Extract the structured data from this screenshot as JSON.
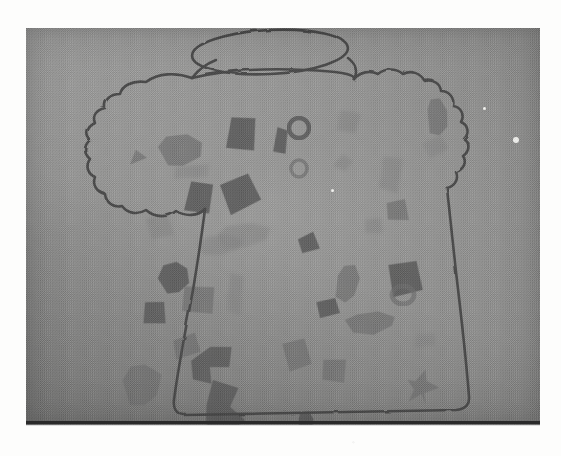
{
  "figure": {
    "kind": "halftone-photograph-of-childrens-drawing",
    "caption": "",
    "label": ""
  },
  "colors": {
    "page_background": "#fdfdfc",
    "photo_paper_mid": "#8e8e8e",
    "photo_paper_light": "#9a9a99",
    "photo_paper_dark": "#767675",
    "pencil_outline": "#4b4b4b",
    "confetti_dark": "#5e5e5e",
    "confetti_mid": "#6e6e6e",
    "confetti_light": "#7e7e7e",
    "bottom_rule": "#2a2a2a",
    "speck_highlight": "#f2f2ef"
  },
  "photo_plate": {
    "x": 26,
    "y": 28,
    "width": 514,
    "height": 397
  },
  "bottom_rule": {
    "x": 26,
    "y": 421,
    "width": 514,
    "height": 3
  },
  "outline": {
    "stroke_width": 2.6,
    "stroke_color": "#4b4b4b",
    "lid_oval": {
      "cx": 244,
      "cy": 24,
      "rx": 78,
      "ry": 22,
      "rotate": -3
    },
    "ruffle_top_path": "M 166 50 C 150 44 132 45 120 54 C 106 52 96 58 94 66 C 84 66 78 72 79 80 C 70 82 66 88 69 95 C 61 99 59 106 64 112 C 57 118 58 126 64 131 C 59 138 62 146 69 149 C 66 157 71 164 79 166 C 80 175 88 180 96 178 C 102 186 112 187 120 182 C 129 190 142 190 150 183 C 160 189 172 188 179 181",
    "body_path": "M 179 181 C 176 205 172 232 167 262 C 160 300 152 340 148 372 C 147 380 150 386 158 387 L 430 382 C 440 381 444 376 443 368 C 440 330 435 286 430 244 C 426 208 423 180 421 160",
    "ruffle_right_path": "M 421 160 C 429 158 433 151 430 144 C 438 141 441 134 437 128 C 444 123 444 115 438 111 C 444 105 442 97 435 94 C 439 87 435 79 427 78 C 429 70 423 63 415 63 C 414 55 406 50 398 52 C 394 45 385 42 377 46 C 370 40 359 40 352 46 C 344 42 334 44 328 51",
    "ruffle_span_path": "M 166 50 C 200 42 240 40 280 42 C 310 43 330 46 328 51",
    "lid_tab_left": "M 166 50 C 172 42 180 36 190 32",
    "lid_tab_right": "M 322 30 C 330 36 332 44 328 51"
  },
  "confetti": [
    {
      "id": "c01",
      "x": 102,
      "y": 122,
      "w": 18,
      "h": 12,
      "rot": -18,
      "tone": "mid",
      "shape": "triangle"
    },
    {
      "id": "c02",
      "x": 130,
      "y": 108,
      "w": 46,
      "h": 30,
      "rot": -8,
      "tone": "mid",
      "shape": "blob"
    },
    {
      "id": "c03",
      "x": 148,
      "y": 138,
      "w": 36,
      "h": 12,
      "rot": -6,
      "tone": "light",
      "shape": "bar"
    },
    {
      "id": "c04",
      "x": 200,
      "y": 86,
      "w": 30,
      "h": 38,
      "rot": 10,
      "tone": "dark",
      "shape": "quad"
    },
    {
      "id": "c05",
      "x": 160,
      "y": 152,
      "w": 26,
      "h": 32,
      "rot": 14,
      "tone": "dark",
      "shape": "quad"
    },
    {
      "id": "c06",
      "x": 196,
      "y": 148,
      "w": 34,
      "h": 34,
      "rot": -20,
      "tone": "dark",
      "shape": "quad"
    },
    {
      "id": "c07",
      "x": 249,
      "y": 100,
      "w": 12,
      "h": 26,
      "rot": 6,
      "tone": "dark",
      "shape": "bar"
    },
    {
      "id": "c08",
      "x": 263,
      "y": 90,
      "w": 20,
      "h": 20,
      "rot": 0,
      "tone": "dark",
      "shape": "ring"
    },
    {
      "id": "c09",
      "x": 265,
      "y": 132,
      "w": 16,
      "h": 17,
      "rot": 0,
      "tone": "mid",
      "shape": "ring"
    },
    {
      "id": "c10",
      "x": 310,
      "y": 82,
      "w": 24,
      "h": 22,
      "rot": 16,
      "tone": "light",
      "shape": "quad"
    },
    {
      "id": "c11",
      "x": 307,
      "y": 126,
      "w": 22,
      "h": 18,
      "rot": -12,
      "tone": "light",
      "shape": "diamond"
    },
    {
      "id": "c12",
      "x": 400,
      "y": 70,
      "w": 22,
      "h": 38,
      "rot": -4,
      "tone": "mid",
      "shape": "blob"
    },
    {
      "id": "c13",
      "x": 398,
      "y": 110,
      "w": 24,
      "h": 18,
      "rot": -24,
      "tone": "light",
      "shape": "quad"
    },
    {
      "id": "c14",
      "x": 355,
      "y": 128,
      "w": 20,
      "h": 36,
      "rot": 4,
      "tone": "light",
      "shape": "bar"
    },
    {
      "id": "c15",
      "x": 357,
      "y": 168,
      "w": 28,
      "h": 28,
      "rot": 42,
      "tone": "mid",
      "shape": "diamond"
    },
    {
      "id": "c16",
      "x": 186,
      "y": 196,
      "w": 58,
      "h": 24,
      "rot": -10,
      "tone": "light",
      "shape": "blob"
    },
    {
      "id": "c17",
      "x": 168,
      "y": 208,
      "w": 48,
      "h": 20,
      "rot": -6,
      "tone": "light",
      "shape": "blob"
    },
    {
      "id": "c18",
      "x": 272,
      "y": 206,
      "w": 20,
      "h": 18,
      "rot": -14,
      "tone": "dark",
      "shape": "quad"
    },
    {
      "id": "c19",
      "x": 130,
      "y": 236,
      "w": 34,
      "h": 30,
      "rot": -16,
      "tone": "dark",
      "shape": "blob"
    },
    {
      "id": "c20",
      "x": 156,
      "y": 258,
      "w": 32,
      "h": 26,
      "rot": 10,
      "tone": "mid",
      "shape": "quad"
    },
    {
      "id": "c21",
      "x": 118,
      "y": 274,
      "w": 22,
      "h": 22,
      "rot": 8,
      "tone": "dark",
      "shape": "quad"
    },
    {
      "id": "c22",
      "x": 200,
      "y": 246,
      "w": 16,
      "h": 40,
      "rot": 4,
      "tone": "light",
      "shape": "bar"
    },
    {
      "id": "c23",
      "x": 308,
      "y": 236,
      "w": 24,
      "h": 38,
      "rot": 8,
      "tone": "mid",
      "shape": "blob"
    },
    {
      "id": "c24",
      "x": 290,
      "y": 270,
      "w": 22,
      "h": 20,
      "rot": -8,
      "tone": "dark",
      "shape": "quad"
    },
    {
      "id": "c25",
      "x": 362,
      "y": 232,
      "w": 36,
      "h": 34,
      "rot": -4,
      "tone": "dark",
      "shape": "quad"
    },
    {
      "id": "c26",
      "x": 366,
      "y": 258,
      "w": 22,
      "h": 18,
      "rot": 0,
      "tone": "mid",
      "shape": "ring"
    },
    {
      "id": "c27",
      "x": 316,
      "y": 284,
      "w": 54,
      "h": 22,
      "rot": -6,
      "tone": "mid",
      "shape": "blob"
    },
    {
      "id": "c28",
      "x": 146,
      "y": 306,
      "w": 28,
      "h": 24,
      "rot": -12,
      "tone": "mid",
      "shape": "quad"
    },
    {
      "id": "c29",
      "x": 92,
      "y": 336,
      "w": 42,
      "h": 44,
      "rot": -6,
      "tone": "mid",
      "shape": "blob"
    },
    {
      "id": "c30",
      "x": 166,
      "y": 318,
      "w": 44,
      "h": 36,
      "rot": -14,
      "tone": "dark",
      "shape": "zig"
    },
    {
      "id": "c31",
      "x": 176,
      "y": 352,
      "w": 40,
      "h": 58,
      "rot": -8,
      "tone": "dark",
      "shape": "zig2"
    },
    {
      "id": "c32",
      "x": 258,
      "y": 312,
      "w": 26,
      "h": 30,
      "rot": -10,
      "tone": "mid",
      "shape": "quad"
    },
    {
      "id": "c33",
      "x": 296,
      "y": 330,
      "w": 24,
      "h": 24,
      "rot": 10,
      "tone": "mid",
      "shape": "quad"
    },
    {
      "id": "c34",
      "x": 270,
      "y": 384,
      "w": 18,
      "h": 24,
      "rot": 0,
      "tone": "dark",
      "shape": "blob"
    },
    {
      "id": "c35",
      "x": 388,
      "y": 306,
      "w": 22,
      "h": 12,
      "rot": -8,
      "tone": "light",
      "shape": "bar"
    },
    {
      "id": "c36",
      "x": 378,
      "y": 342,
      "w": 34,
      "h": 34,
      "rot": 12,
      "tone": "mid",
      "shape": "star"
    },
    {
      "id": "c37",
      "x": 120,
      "y": 188,
      "w": 26,
      "h": 22,
      "rot": -10,
      "tone": "light",
      "shape": "quad"
    },
    {
      "id": "c38",
      "x": 338,
      "y": 190,
      "w": 18,
      "h": 16,
      "rot": 6,
      "tone": "light",
      "shape": "quad"
    }
  ],
  "specks": [
    {
      "id": "s1",
      "x": 490,
      "y": 112,
      "r": 3
    },
    {
      "id": "s2",
      "x": 458,
      "y": 80,
      "r": 1.5
    },
    {
      "id": "s3",
      "x": 306,
      "y": 162,
      "r": 1.5
    }
  ]
}
